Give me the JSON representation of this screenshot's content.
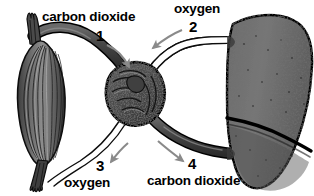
{
  "figure": {
    "background_color": "#ffffff",
    "ink_color": "#000000",
    "organ_fill_color": "#6e6e6e",
    "vessel_dark_color": "#4a4a4a",
    "vessel_light_color": "#ffffff",
    "arrow_color": "#8a8a8a"
  },
  "labels": {
    "carbon_dioxide_top": "carbon dioxide",
    "number_1": "1",
    "oxygen_top": "oxygen",
    "number_2": "2",
    "number_3": "3",
    "oxygen_bottom": "oxygen",
    "number_4": "4",
    "carbon_dioxide_bottom": "carbon dioxide"
  },
  "organs": [
    {
      "id": "muscle",
      "name": "muscle",
      "position": "left"
    },
    {
      "id": "heart",
      "name": "heart",
      "position": "center"
    },
    {
      "id": "lung",
      "name": "lung",
      "position": "right"
    }
  ],
  "pathways": [
    {
      "number": "1",
      "gas": "carbon dioxide",
      "from": "muscle",
      "to": "heart",
      "vessel_style": "dark",
      "arrow_direction": "down-right"
    },
    {
      "number": "2",
      "gas": "oxygen",
      "from": "lung",
      "to": "heart",
      "vessel_style": "light",
      "arrow_direction": "down-left"
    },
    {
      "number": "3",
      "gas": "oxygen",
      "from": "heart",
      "to": "muscle",
      "vessel_style": "light",
      "arrow_direction": "down-left"
    },
    {
      "number": "4",
      "gas": "carbon dioxide",
      "from": "heart",
      "to": "lung",
      "vessel_style": "dark",
      "arrow_direction": "down-right"
    }
  ]
}
